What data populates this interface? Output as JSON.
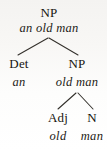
{
  "figure": {
    "kind": "syntax-tree",
    "background_color": "#fbfbfa",
    "ink_color": "#1c1a18",
    "branch_color": "#33302b"
  },
  "tree": {
    "nodes": [
      {
        "id": "root-np",
        "label": "NP",
        "string": "an old man",
        "level": 0,
        "x": 49,
        "label_y": 6,
        "string_y": 22
      },
      {
        "id": "det",
        "label": "Det",
        "string": "an",
        "level": 1,
        "x": 19,
        "label_y": 57,
        "string_y": 76
      },
      {
        "id": "inner-np",
        "label": "NP",
        "string": "old man",
        "level": 1,
        "x": 77,
        "label_y": 57,
        "string_y": 76
      },
      {
        "id": "adj",
        "label": "Adj",
        "string": "old",
        "level": 2,
        "x": 58,
        "label_y": 111,
        "string_y": 130
      },
      {
        "id": "noun",
        "label": "N",
        "string": "man",
        "level": 2,
        "x": 92,
        "label_y": 111,
        "string_y": 130
      }
    ],
    "branches": [
      {
        "id": "root-to-det",
        "from_x": 48,
        "from_y": 38,
        "to_x": 18,
        "to_y": 55
      },
      {
        "id": "root-to-np",
        "from_x": 49,
        "from_y": 38,
        "to_x": 78,
        "to_y": 55
      },
      {
        "id": "np-to-adj",
        "from_x": 76,
        "from_y": 93,
        "to_x": 58,
        "to_y": 109
      },
      {
        "id": "np-to-n",
        "from_x": 78,
        "from_y": 93,
        "to_x": 93,
        "to_y": 109
      }
    ]
  }
}
